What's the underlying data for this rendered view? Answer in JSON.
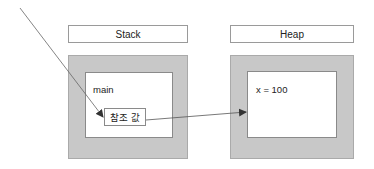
{
  "diagram": {
    "stack": {
      "title": "Stack",
      "frame": {
        "label": "main",
        "reference_box": "참조 값"
      }
    },
    "heap": {
      "title": "Heap",
      "object": {
        "content": "x = 100"
      }
    },
    "arrows": [
      {
        "from": "outside-top-left",
        "to": "reference-box"
      },
      {
        "from": "reference-box",
        "to": "heap-object"
      }
    ],
    "colors": {
      "region_fill": "#c8c8c8",
      "box_fill": "#ffffff",
      "border": "#8a8a8a",
      "arrow": "#555555"
    }
  }
}
